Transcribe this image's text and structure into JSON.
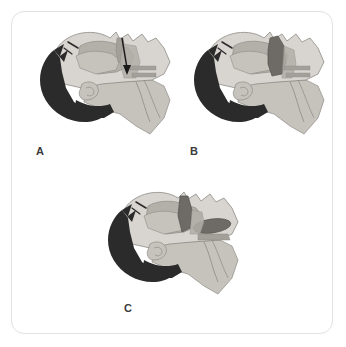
{
  "figure": {
    "background_color": "#ffffff",
    "frame_color": "#e2e2e2"
  },
  "palette": {
    "hair_dark": "#2b2b2b",
    "skin_light": "#d8d5d0",
    "skin_mid": "#c6c3bd",
    "tissue_gray": "#b3b0aa",
    "tissue_mid_gray": "#a3a09a",
    "obstruction_dark": "#6e6b66",
    "outline": "#8e8b86",
    "arrow": "#1a1a1a",
    "label_text": "#3a3a3a"
  },
  "panels": [
    {
      "id": "A",
      "label": "A",
      "description": "Sagittal head and neck, open airway with downward arrow indicating inspiratory airflow",
      "has_arrow": true,
      "arrow_direction": "down",
      "obstruction_level": "none"
    },
    {
      "id": "B",
      "label": "B",
      "description": "Sagittal head and neck, soft palate collapse narrowing the airway",
      "has_arrow": false,
      "arrow_direction": "",
      "obstruction_level": "partial"
    },
    {
      "id": "C",
      "label": "C",
      "description": "Sagittal head and neck, tongue base and soft palate displaced, complete airway obstruction",
      "has_arrow": false,
      "arrow_direction": "",
      "obstruction_level": "complete"
    }
  ]
}
